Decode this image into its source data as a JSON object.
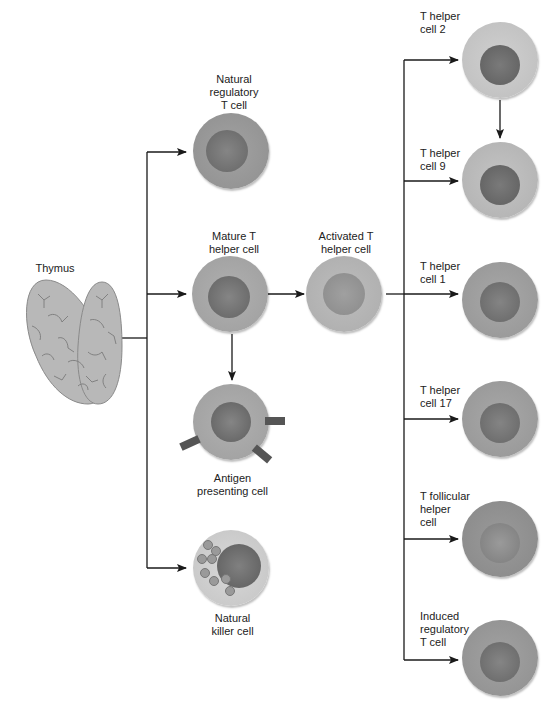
{
  "diagram": {
    "type": "flow",
    "title": "",
    "colors": {
      "line": "#1a1a1a",
      "cell_light": "#c6c6c6",
      "cell_medium": "#a9a9a9",
      "cell_dark": "#8e8e8e",
      "nucleus": "#6e6e6e",
      "nucleus_light": "#8a8a8a",
      "receptor": "#555555",
      "thymus": "#b8b8b8"
    },
    "nodes": {
      "thymus": {
        "label": "Thymus"
      },
      "natural_regulatory_t": {
        "label_lines": [
          "Natural",
          "regulatory",
          "T cell"
        ]
      },
      "mature_t_helper": {
        "label_lines": [
          "Mature T",
          "helper cell"
        ]
      },
      "antigen_presenting": {
        "label_lines": [
          "Antigen",
          "presenting cell"
        ]
      },
      "natural_killer": {
        "label_lines": [
          "Natural",
          "killer cell"
        ]
      },
      "activated_t_helper": {
        "label_lines": [
          "Activated T",
          "helper cell"
        ]
      },
      "th2": {
        "label_lines": [
          "T helper",
          "cell 2"
        ]
      },
      "th9": {
        "label_lines": [
          "T helper",
          "cell 9"
        ]
      },
      "th1": {
        "label_lines": [
          "T helper",
          "cell 1"
        ]
      },
      "th17": {
        "label_lines": [
          "T helper",
          "cell 17"
        ]
      },
      "tfh": {
        "label_lines": [
          "T follicular",
          "helper",
          "cell"
        ]
      },
      "itreg": {
        "label_lines": [
          "Induced",
          "regulatory",
          "T cell"
        ]
      }
    },
    "edges": [
      {
        "from": "Thymus",
        "to": "Natural regulatory T cell"
      },
      {
        "from": "Thymus",
        "to": "Mature T helper cell"
      },
      {
        "from": "Thymus",
        "to": "Natural killer cell"
      },
      {
        "from": "Mature T helper cell",
        "to": "Activated T helper cell"
      },
      {
        "from": "Mature T helper cell",
        "to": "Antigen presenting cell"
      },
      {
        "from": "Activated T helper cell",
        "to": "T helper cell 2"
      },
      {
        "from": "Activated T helper cell",
        "to": "T helper cell 9"
      },
      {
        "from": "Activated T helper cell",
        "to": "T helper cell 1"
      },
      {
        "from": "Activated T helper cell",
        "to": "T helper cell 17"
      },
      {
        "from": "Activated T helper cell",
        "to": "T follicular helper cell"
      },
      {
        "from": "Activated T helper cell",
        "to": "Induced regulatory T cell"
      },
      {
        "from": "T helper cell 2",
        "to": "T helper cell 9"
      }
    ]
  }
}
